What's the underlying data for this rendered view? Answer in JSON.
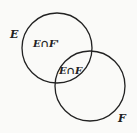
{
  "diagram": {
    "type": "venn",
    "sets": [
      {
        "name": "E",
        "label": "E"
      },
      {
        "name": "F",
        "label": "F"
      }
    ],
    "regions": [
      {
        "label": "E∩F'"
      },
      {
        "label": "E∩F"
      }
    ],
    "stroke_color": "#222222",
    "background": "#fafaf8"
  }
}
